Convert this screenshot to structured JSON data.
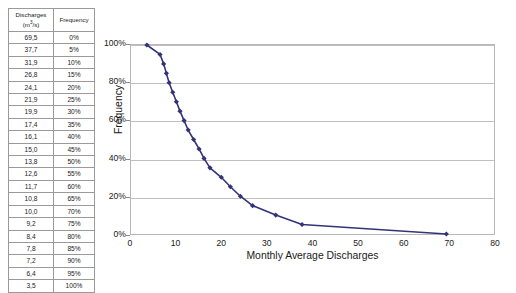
{
  "table": {
    "headers": {
      "discharge": "Discharges",
      "discharge_unit_prefix": "(m",
      "discharge_unit_exp": "3",
      "discharge_unit_suffix": "/s)",
      "frequency": "Frequency"
    },
    "rows": [
      {
        "discharge": "69,5",
        "frequency": "0%"
      },
      {
        "discharge": "37,7",
        "frequency": "5%"
      },
      {
        "discharge": "31,9",
        "frequency": "10%"
      },
      {
        "discharge": "26,8",
        "frequency": "15%"
      },
      {
        "discharge": "24,1",
        "frequency": "20%"
      },
      {
        "discharge": "21,9",
        "frequency": "25%"
      },
      {
        "discharge": "19,9",
        "frequency": "30%"
      },
      {
        "discharge": "17,4",
        "frequency": "35%"
      },
      {
        "discharge": "16,1",
        "frequency": "40%"
      },
      {
        "discharge": "15,0",
        "frequency": "45%"
      },
      {
        "discharge": "13,8",
        "frequency": "50%"
      },
      {
        "discharge": "12,6",
        "frequency": "55%"
      },
      {
        "discharge": "11,7",
        "frequency": "60%"
      },
      {
        "discharge": "10,8",
        "frequency": "65%"
      },
      {
        "discharge": "10,0",
        "frequency": "70%"
      },
      {
        "discharge": "9,2",
        "frequency": "75%"
      },
      {
        "discharge": "8,4",
        "frequency": "80%"
      },
      {
        "discharge": "7,8",
        "frequency": "85%"
      },
      {
        "discharge": "7,2",
        "frequency": "90%"
      },
      {
        "discharge": "6,4",
        "frequency": "95%"
      },
      {
        "discharge": "3,5",
        "frequency": "100%"
      }
    ]
  },
  "chart_data": {
    "type": "line",
    "title": "",
    "xlabel": "Monthly Average Discharges",
    "ylabel": "Frequency",
    "xlim": [
      0,
      80
    ],
    "ylim": [
      0,
      100
    ],
    "xticks": [
      0,
      10,
      20,
      30,
      40,
      50,
      60,
      70,
      80
    ],
    "xtick_labels": [
      "0",
      "10",
      "20",
      "30",
      "40",
      "50",
      "60",
      "70",
      "80"
    ],
    "yticks": [
      0,
      20,
      40,
      60,
      80,
      100
    ],
    "ytick_labels": [
      "0%",
      "20%",
      "40%",
      "60%",
      "80%",
      "100%"
    ],
    "grid": "horizontal",
    "legend": "none",
    "marker": "diamond",
    "series_color": "#333377",
    "series": [
      {
        "name": "Flow duration curve",
        "x": [
          3.5,
          6.4,
          7.2,
          7.8,
          8.4,
          9.2,
          10.0,
          10.8,
          11.7,
          12.6,
          13.8,
          15.0,
          16.1,
          17.4,
          19.9,
          21.9,
          24.1,
          26.8,
          31.9,
          37.7,
          69.5
        ],
        "y": [
          100,
          95,
          90,
          85,
          80,
          75,
          70,
          65,
          60,
          55,
          50,
          45,
          40,
          35,
          30,
          25,
          20,
          15,
          10,
          5,
          0
        ]
      }
    ]
  }
}
